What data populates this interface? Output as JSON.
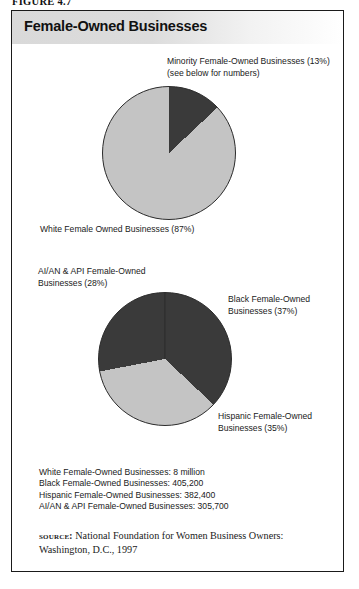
{
  "figure": {
    "caption": "FIGURE 4.7",
    "title": "Female-Owned Businesses"
  },
  "labels": {
    "minority": "Minority Female-Owned Businesses (13%)\n(see below for numbers)",
    "white": "White Female Owned Businesses (87%)",
    "aian": "AI/AN & API Female-Owned\nBusinesses (28%)",
    "black": "Black Female-Owned\nBusinesses (37%)",
    "hispanic": "Hispanic Female-Owned\nBusinesses (35%)"
  },
  "numbers": [
    "White Female-Owned Businesses: 8 million",
    "Black Female-Owned Businesses: 405,200",
    "Hispanic Female-Owned Businesses: 382,400",
    "AI/AN & API Female-Owned Businesses: 305,700"
  ],
  "source": {
    "kicker": "source:",
    "text": " National Foundation for Women Business Owners: Washington, D.C., 1997"
  },
  "colors": {
    "dark_slice": "#3a3a3a",
    "light_slice": "#c4c4c4",
    "outline": "#2b2b2b",
    "title_band": "#d9d9d9"
  },
  "chart_data": [
    {
      "type": "pie",
      "title": "Female-Owned Businesses — all",
      "categories": [
        "Minority Female-Owned Businesses",
        "White Female Owned Businesses"
      ],
      "values": [
        13,
        87
      ],
      "unit": "percent",
      "colors": [
        "#3a3a3a",
        "#c4c4c4"
      ],
      "start_angle_deg": 0,
      "direction": "clockwise",
      "legend": "labels placed outside slices"
    },
    {
      "type": "pie",
      "title": "Minority Female-Owned Businesses breakdown",
      "categories": [
        "Black Female-Owned Businesses",
        "Hispanic Female-Owned Businesses",
        "AI/AN & API Female-Owned Businesses"
      ],
      "values": [
        37,
        35,
        28
      ],
      "unit": "percent",
      "colors": [
        "#3a3a3a",
        "#c4c4c4",
        "#3a3a3a"
      ],
      "start_angle_deg": 0,
      "direction": "clockwise",
      "legend": "labels placed outside slices",
      "counts": {
        "White Female-Owned Businesses": "8 million",
        "Black Female-Owned Businesses": "405,200",
        "Hispanic Female-Owned Businesses": "382,400",
        "AI/AN & API Female-Owned Businesses": "305,700"
      }
    }
  ]
}
